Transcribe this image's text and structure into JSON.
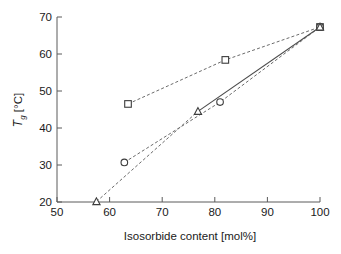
{
  "chart_data": {
    "type": "scatter",
    "title": "",
    "xlabel": "Isosorbide content [mol%]",
    "ylabel": "Tg [°C]",
    "ylabel_main": "T",
    "ylabel_sub": "g",
    "ylabel_unit": " [°C]",
    "xlim": [
      50,
      100
    ],
    "ylim": [
      20,
      70
    ],
    "xticks": [
      50,
      60,
      70,
      80,
      90,
      100
    ],
    "yticks": [
      20,
      30,
      40,
      50,
      60,
      70
    ],
    "grid": false,
    "legend": "none",
    "series": [
      {
        "name": "squares",
        "marker": "square",
        "linestyle": "dashed",
        "points": [
          {
            "x": 63.5,
            "y": 46.5
          },
          {
            "x": 82.0,
            "y": 58.4
          },
          {
            "x": 100.0,
            "y": 67.3
          }
        ]
      },
      {
        "name": "circles",
        "marker": "circle",
        "linestyle": "dashed",
        "points": [
          {
            "x": 62.8,
            "y": 30.7
          },
          {
            "x": 81.0,
            "y": 47.0
          },
          {
            "x": 100.0,
            "y": 67.3
          }
        ]
      },
      {
        "name": "triangles",
        "marker": "triangle",
        "linestyle": "dashed-then-solid",
        "points": [
          {
            "x": 57.5,
            "y": 20.1
          },
          {
            "x": 76.8,
            "y": 44.5
          },
          {
            "x": 100.0,
            "y": 67.3
          }
        ]
      }
    ]
  },
  "axes": {
    "x_tick_labels": [
      "50",
      "60",
      "70",
      "80",
      "90",
      "100"
    ],
    "y_tick_labels": [
      "20",
      "30",
      "40",
      "50",
      "60",
      "70"
    ]
  },
  "colors": {
    "axis": "#5a5a5a",
    "marker_stroke": "#3c3c3c",
    "line_dashed": "#6b6b6b",
    "line_solid": "#4a4a4a",
    "text": "#1a1a1a",
    "background": "#ffffff"
  }
}
